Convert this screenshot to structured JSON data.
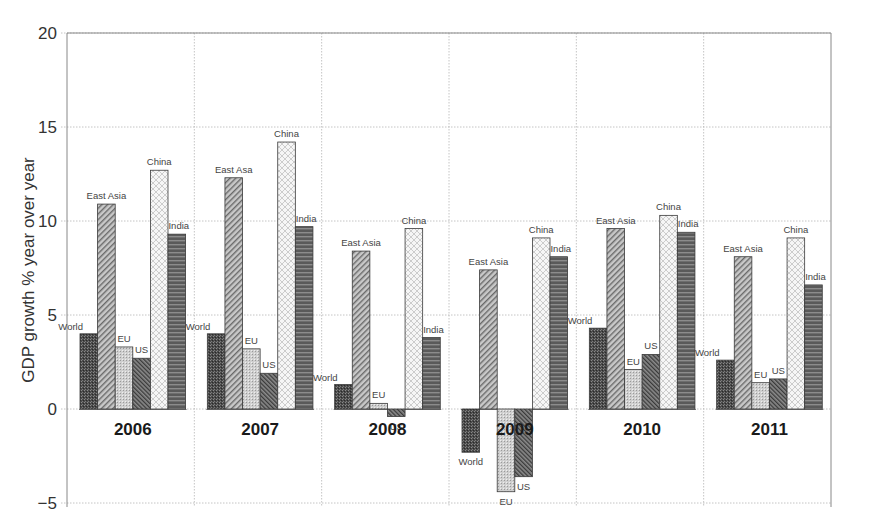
{
  "chart_data": {
    "type": "bar",
    "title": "",
    "xlabel": "",
    "ylabel": "GDP growth % year over year",
    "ylim": [
      -5,
      20
    ],
    "yticks": [
      -5,
      0,
      5,
      10,
      15,
      20
    ],
    "ytick_labels": [
      "−5",
      "0",
      "5",
      "10",
      "15",
      "20"
    ],
    "grid": true,
    "legend": "none (bars labeled individually)",
    "categories": [
      "2006",
      "2007",
      "2008",
      "2009",
      "2010",
      "2011"
    ],
    "series": [
      {
        "name": "World",
        "pattern": "dense-dark",
        "values": [
          4.0,
          4.0,
          1.3,
          -2.3,
          4.3,
          2.6
        ]
      },
      {
        "name": "East Asia",
        "pattern": "diagonal-hatch",
        "values": [
          10.9,
          12.3,
          8.4,
          7.4,
          9.6,
          8.1
        ]
      },
      {
        "name": "EU",
        "pattern": "light-dots",
        "values": [
          3.3,
          3.2,
          0.3,
          -4.4,
          2.1,
          1.4
        ]
      },
      {
        "name": "US",
        "pattern": "dark-diagonal",
        "values": [
          2.7,
          1.9,
          -0.4,
          -3.6,
          2.9,
          1.6
        ]
      },
      {
        "name": "China",
        "pattern": "white-crosshatch",
        "values": [
          12.7,
          14.2,
          9.6,
          9.1,
          10.3,
          9.1
        ]
      },
      {
        "name": "India",
        "pattern": "horizontal-stripes",
        "values": [
          9.3,
          9.7,
          3.8,
          8.1,
          9.4,
          6.6
        ]
      }
    ],
    "bar_labels": [
      [
        "World",
        "East Asia",
        "EU",
        "US",
        "China",
        "India"
      ],
      [
        "World",
        "East Asa",
        "EU",
        "US",
        "China",
        "India"
      ],
      [
        "World",
        "East Asia",
        "EU",
        "US",
        "China",
        "India"
      ],
      [
        "World",
        "East Asia",
        "EU",
        "US",
        "China",
        "India"
      ],
      [
        "World",
        "East Asia",
        "EU",
        "US",
        "China",
        "India"
      ],
      [
        "World",
        "East Asia",
        "EU",
        "US",
        "China",
        "India"
      ]
    ]
  }
}
